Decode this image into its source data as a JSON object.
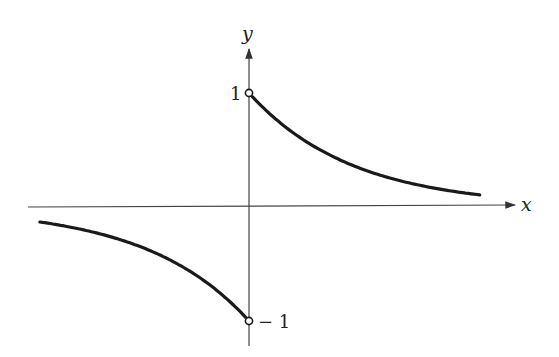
{
  "chart_data": {
    "type": "line",
    "title": "",
    "xlabel": "x",
    "ylabel": "y",
    "series": [
      {
        "name": "right branch",
        "x": [
          0,
          0.25,
          0.5,
          0.75,
          1.0,
          1.25,
          1.5,
          1.75,
          2.0,
          2.25
        ],
        "values": [
          1.0,
          0.78,
          0.61,
          0.47,
          0.37,
          0.29,
          0.22,
          0.17,
          0.14,
          0.105
        ]
      },
      {
        "name": "left branch",
        "x": [
          -2.0,
          -1.75,
          -1.5,
          -1.25,
          -1.0,
          -0.75,
          -0.5,
          -0.25,
          0
        ],
        "values": [
          -0.09,
          -0.17,
          -0.22,
          -0.29,
          -0.37,
          -0.47,
          -0.61,
          -0.78,
          -1.0
        ]
      }
    ],
    "tick_labels": {
      "y": [
        "1",
        "−1"
      ]
    },
    "annotations": [
      "open circle at (0, 1)",
      "open circle at (0, -1)"
    ],
    "ylim": [
      -1.2,
      1.4
    ],
    "xlim": [
      -2.1,
      2.6
    ],
    "grid": false,
    "legend": "none"
  },
  "labels": {
    "x_axis": "x",
    "y_axis": "y",
    "tick_pos": "1",
    "tick_neg": "− 1"
  }
}
